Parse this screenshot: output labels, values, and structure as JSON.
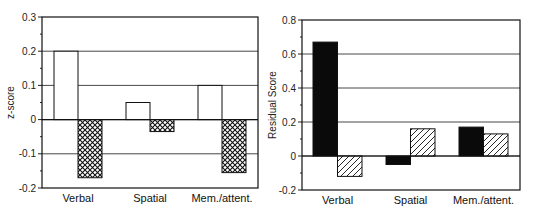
{
  "chart_data": [
    {
      "type": "bar",
      "title": "",
      "xlabel": "",
      "ylabel": "z-score",
      "ylim": [
        -0.2,
        0.3
      ],
      "yticks": [
        0.3,
        0.2,
        0.1,
        0,
        -0.1,
        -0.2
      ],
      "ytick_labels": [
        "0.3",
        "0.2",
        "0.1",
        "0",
        "-0.1",
        "-0.2"
      ],
      "grid": true,
      "legend": null,
      "categories": [
        "Verbal",
        "Spatial",
        "Mem./attent."
      ],
      "series": [
        {
          "name": "series-1 (open)",
          "fill": "white",
          "values": [
            0.2,
            0.05,
            0.1
          ]
        },
        {
          "name": "series-2 (crosshatch)",
          "fill": "crosshatch",
          "values": [
            -0.17,
            -0.035,
            -0.155
          ]
        }
      ]
    },
    {
      "type": "bar",
      "title": "",
      "xlabel": "",
      "ylabel": "Residual Score",
      "ylim": [
        -0.2,
        0.8
      ],
      "yticks": [
        0.8,
        0.6,
        0.4,
        0.2,
        0,
        -0.2
      ],
      "ytick_labels": [
        "0.8",
        "0.6",
        "0.4",
        "0.2",
        "0",
        "-0.2"
      ],
      "grid": true,
      "legend": null,
      "categories": [
        "Verbal",
        "Spatial",
        "Mem./attent."
      ],
      "series": [
        {
          "name": "series-1 (solid)",
          "fill": "black",
          "values": [
            0.67,
            -0.05,
            0.17
          ]
        },
        {
          "name": "series-2 (diagonal hatch)",
          "fill": "diagonal",
          "values": [
            -0.12,
            0.16,
            0.13
          ]
        }
      ]
    }
  ]
}
